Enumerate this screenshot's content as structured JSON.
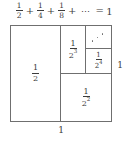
{
  "figure": {
    "title_equation": {
      "terms": [
        {
          "numerator": "1",
          "denominator": "2",
          "exponent": ""
        },
        {
          "numerator": "1",
          "denominator": "4",
          "exponent": ""
        },
        {
          "numerator": "1",
          "denominator": "8",
          "exponent": ""
        }
      ],
      "plus_1": "+",
      "plus_2": "+",
      "plus_3": "+",
      "ellipsis": "⋯",
      "equals": "=",
      "result": "1",
      "plain_text": "1/2 + 1/4 + 1/8 + ⋯ = 1"
    },
    "square": {
      "description": "unit square partitioned into halves of successively halved area",
      "width_label": "1",
      "height_label": "1",
      "cells": [
        {
          "id": "half",
          "numerator": "1",
          "denominator": "2",
          "exponent": "",
          "area": 0.5
        },
        {
          "id": "quarter",
          "numerator": "1",
          "denominator": "2",
          "exponent": "2",
          "area": 0.25
        },
        {
          "id": "eighth",
          "numerator": "1",
          "denominator": "2",
          "exponent": "3",
          "area": 0.125
        },
        {
          "id": "sixteenth",
          "numerator": "1",
          "denominator": "2",
          "exponent": "4",
          "area": 0.0625
        },
        {
          "id": "dots",
          "numerator": "",
          "denominator": "",
          "exponent": "",
          "area": 0.0625
        }
      ]
    },
    "colors": {
      "ink": "#3c3c3c",
      "rule": "#6f6f6f",
      "background": "#ffffff",
      "dot": "#6a6a6a"
    }
  },
  "chart_data": {
    "type": "area",
    "title": "1/2 + 1/4 + 1/8 + ⋯ = 1",
    "xlabel": "1",
    "ylabel": "1",
    "categories": [
      "1/2",
      "1/2^2",
      "1/2^3",
      "1/2^4",
      "..."
    ],
    "values": [
      0.5,
      0.25,
      0.125,
      0.0625,
      0.0625
    ],
    "xlim": [
      0,
      1
    ],
    "ylim": [
      0,
      1
    ],
    "grid": false,
    "legend": "none",
    "annotations": [
      "⋰"
    ]
  }
}
